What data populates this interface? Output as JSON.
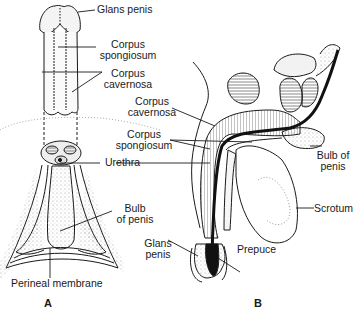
{
  "figure": {
    "panel_a": {
      "letter": "A",
      "labels": {
        "glans_penis": "Glans penis",
        "corpus_spongiosum_1": "Corpus",
        "corpus_spongiosum_2": "spongiosum",
        "corpus_cavernosa_1": "Corpus",
        "corpus_cavernosa_2": "cavernosa",
        "urethra": "Urethra",
        "bulb_of_penis_1": "Bulb",
        "bulb_of_penis_2": "of penis",
        "perineal_membrane": "Perineal membrane"
      }
    },
    "panel_b": {
      "letter": "B",
      "labels": {
        "corpus_cavernosa_1": "Corpus",
        "corpus_cavernosa_2": "cavernosa",
        "corpus_spongiosum_1": "Corpus",
        "corpus_spongiosum_2": "spongiosum",
        "bulb_of_penis_1": "Bulb of",
        "bulb_of_penis_2": "penis",
        "scrotum": "Scrotum",
        "glans_penis_1": "Glans",
        "glans_penis_2": "penis",
        "prepuce": "Prepuce"
      }
    },
    "colors": {
      "ink": "#1a1a1a",
      "stipple": "#9a9a9a",
      "background": "#ffffff"
    }
  }
}
